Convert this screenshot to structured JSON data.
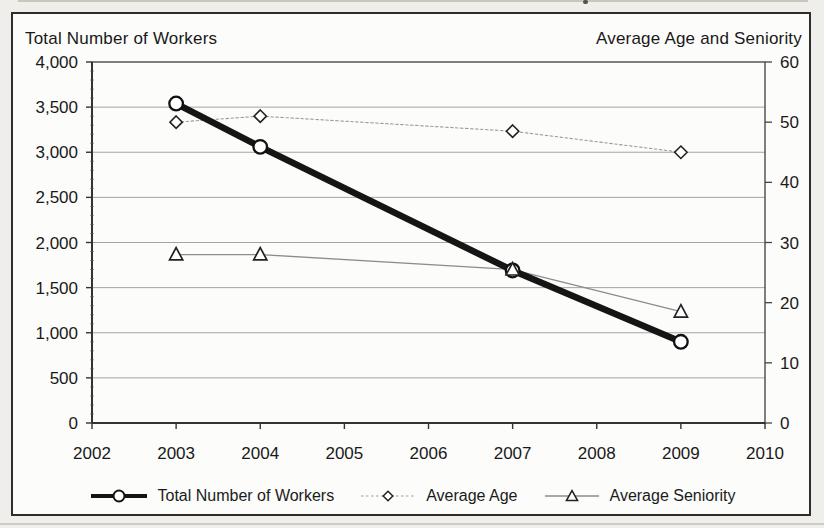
{
  "figure": {
    "left_axis_title": "Total Number of Workers",
    "right_axis_title": "Average Age and Seniority"
  },
  "chart_data": {
    "type": "line",
    "title": "",
    "x": [
      2003,
      2004,
      2007,
      2009
    ],
    "x_axis": {
      "min": 2002,
      "max": 2010,
      "tick_step": 1,
      "tick_labels": [
        "2002",
        "2003",
        "2004",
        "2005",
        "2006",
        "2007",
        "2008",
        "2009",
        "2010"
      ]
    },
    "y_left": {
      "label": "Total Number of Workers",
      "min": 0,
      "max": 4000,
      "gridline_step": 500,
      "tick_labels": [
        "4,000",
        "3,500",
        "3,000",
        "2,500",
        "2,000",
        "1,500",
        "1,000",
        "500",
        "0"
      ],
      "tick_values": [
        4000,
        3500,
        3000,
        2500,
        2000,
        1500,
        1000,
        500,
        0
      ]
    },
    "y_right": {
      "label": "Average Age and Seniority",
      "min": 0,
      "max": 60,
      "tick_step": 10,
      "tick_labels": [
        "60",
        "50",
        "40",
        "30",
        "20",
        "10",
        "0"
      ],
      "tick_values": [
        60,
        50,
        40,
        30,
        20,
        10,
        0
      ]
    },
    "grid": "horizontal-from-left-axis",
    "legend_position": "bottom",
    "series": [
      {
        "name": "Total Number of Workers",
        "axis": "left",
        "marker": "circle",
        "line": "thick-solid",
        "color": "#151515",
        "values": [
          3540,
          3060,
          1690,
          900
        ]
      },
      {
        "name": "Average Age",
        "axis": "right",
        "marker": "diamond",
        "line": "thin-dotted",
        "color": "#9b9b9b",
        "values": [
          50,
          51,
          48.5,
          45
        ]
      },
      {
        "name": "Average Seniority",
        "axis": "right",
        "marker": "triangle",
        "line": "thin-solid",
        "color": "#8c8c8c",
        "values": [
          28,
          28,
          25.5,
          18.5
        ]
      }
    ]
  }
}
